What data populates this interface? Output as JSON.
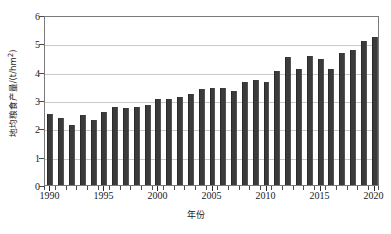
{
  "chart_data": {
    "type": "bar",
    "title": "",
    "xlabel": "年份",
    "ylabel": "地均粮食产量/(t/hm²)",
    "ylabel_text": "地均粮食产量/(t/hm",
    "ylabel_sup": "2",
    "ylabel_tail": ")",
    "ylim": [
      0,
      6
    ],
    "xlim": [
      1990,
      2020
    ],
    "grid": true,
    "legend": "none",
    "y_ticks": [
      0,
      1,
      2,
      3,
      4,
      5,
      6
    ],
    "y_tick_labels": [
      "0",
      "1",
      "2",
      "3",
      "4",
      "5",
      "6"
    ],
    "x_tick_labels": [
      "1990",
      "1995",
      "2000",
      "2005",
      "2010",
      "2015",
      "2020"
    ],
    "x_tick_values": [
      1990,
      1995,
      2000,
      2005,
      2010,
      2015,
      2020
    ],
    "bar_color": "#3b3b3b",
    "grid_color": "#c9c9c9",
    "frame_color": "#7a7a7a",
    "categories": [
      "1990",
      "1991",
      "1992",
      "1993",
      "1994",
      "1995",
      "1996",
      "1997",
      "1998",
      "1999",
      "2000",
      "2001",
      "2002",
      "2003",
      "2004",
      "2005",
      "2006",
      "2007",
      "2008",
      "2009",
      "2010",
      "2011",
      "2012",
      "2013",
      "2014",
      "2015",
      "2016",
      "2017",
      "2018",
      "2019",
      "2020"
    ],
    "values": [
      2.5,
      2.38,
      2.11,
      2.48,
      2.3,
      2.59,
      2.74,
      2.71,
      2.74,
      2.83,
      3.05,
      3.04,
      3.09,
      3.21,
      3.4,
      3.44,
      3.41,
      3.31,
      3.65,
      3.72,
      3.62,
      4.02,
      4.51,
      4.1,
      4.56,
      4.43,
      4.1,
      4.65,
      4.77,
      5.07,
      5.21
    ]
  }
}
